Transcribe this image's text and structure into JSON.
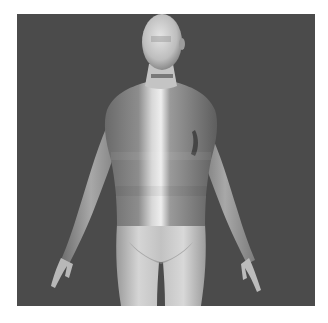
{
  "image": {
    "subject": "3D mannequin female figure in A-pose, grayscale render",
    "background_color": "#4b4b4b",
    "border_color": "#ffffff"
  }
}
